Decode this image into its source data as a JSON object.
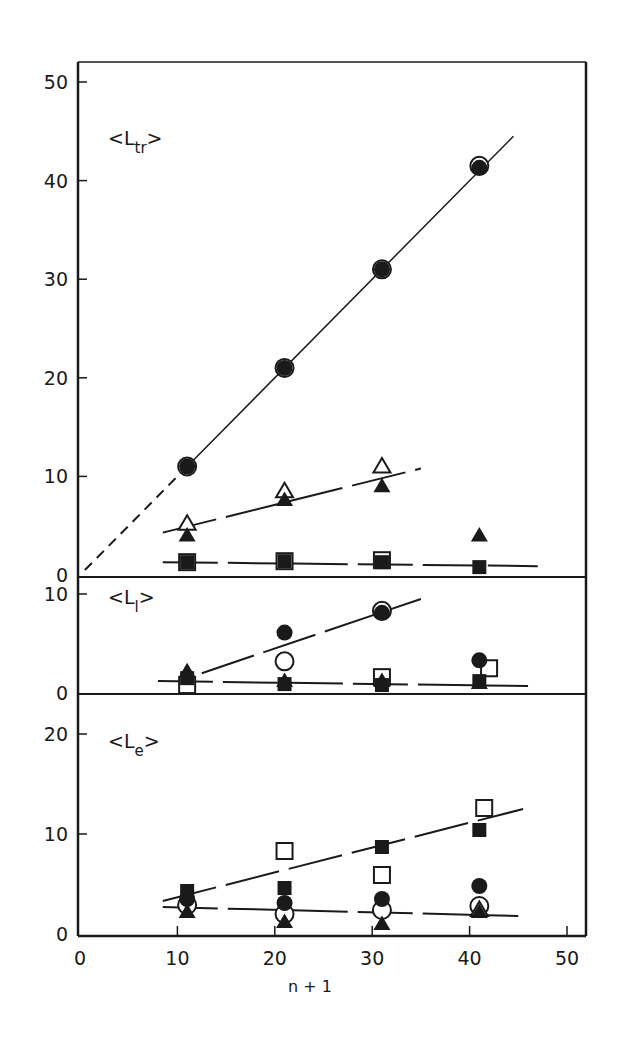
{
  "chart_data": {
    "type": "scatter",
    "xlabel": "n + 1",
    "xlim": [
      0,
      50
    ],
    "xticks": [
      0,
      10,
      20,
      30,
      40,
      50
    ],
    "colors": {
      "ink": "#1a1a1a",
      "background": "#ffffff"
    },
    "panels": [
      {
        "id": "Ltr",
        "label_main": "<L",
        "label_sub": "tr",
        "label_close": ">",
        "ylim": [
          0,
          50
        ],
        "yticks": [
          0,
          10,
          20,
          30,
          40,
          50
        ],
        "series": [
          {
            "name": "open circle",
            "marker": "circle-open",
            "x": [
              11,
              21,
              31,
              41
            ],
            "y": [
              11,
              21,
              31,
              41.5
            ]
          },
          {
            "name": "filled circle",
            "marker": "circle-filled",
            "x": [
              11,
              21,
              31,
              41
            ],
            "y": [
              11,
              21,
              31,
              41.3
            ]
          },
          {
            "name": "open triangle",
            "marker": "triangle-open",
            "x": [
              11,
              21,
              31
            ],
            "y": [
              5.2,
              8.5,
              11
            ]
          },
          {
            "name": "filled triangle",
            "marker": "triangle-filled",
            "x": [
              11,
              21,
              31,
              41
            ],
            "y": [
              4,
              7.6,
              9,
              4
            ]
          },
          {
            "name": "open square",
            "marker": "square-open",
            "x": [
              11,
              21,
              31
            ],
            "y": [
              1.3,
              1.4,
              1.5
            ]
          },
          {
            "name": "filled square",
            "marker": "square-filled",
            "x": [
              11,
              21,
              31,
              41
            ],
            "y": [
              1.3,
              1.4,
              1.3,
              0.8
            ]
          }
        ],
        "fit_lines": [
          {
            "name": "Ltr circle fit",
            "style": "solid",
            "x": [
              11,
              44.5
            ],
            "y": [
              11,
              44.5
            ]
          },
          {
            "name": "Ltr circle extrapolation",
            "style": "dashed",
            "x": [
              0.5,
              11
            ],
            "y": [
              0.5,
              11
            ]
          },
          {
            "name": "Ltr triangle fit",
            "style": "long-dash",
            "x": [
              8.5,
              35
            ],
            "y": [
              4.3,
              10.8
            ]
          },
          {
            "name": "Ltr square fit",
            "style": "long-dash",
            "x": [
              8.5,
              47
            ],
            "y": [
              1.3,
              0.9
            ]
          }
        ]
      },
      {
        "id": "Ll",
        "label_main": "<L",
        "label_sub": "l",
        "label_close": ">",
        "ylim": [
          0,
          11.5
        ],
        "yticks": [
          0,
          10
        ],
        "series": [
          {
            "name": "filled circle",
            "marker": "circle-filled",
            "x": [
              21,
              31,
              41
            ],
            "y": [
              6.1,
              8.1,
              3.3
            ]
          },
          {
            "name": "open circle",
            "marker": "circle-open",
            "x": [
              21,
              31
            ],
            "y": [
              3.2,
              8.3
            ]
          },
          {
            "name": "filled triangle",
            "marker": "triangle-filled",
            "x": [
              11,
              21,
              31,
              41
            ],
            "y": [
              2.2,
              1.2,
              1.2,
              1.0
            ]
          },
          {
            "name": "open square",
            "marker": "square-open",
            "x": [
              11,
              31,
              42
            ],
            "y": [
              0.8,
              1.6,
              2.5
            ]
          },
          {
            "name": "filled square",
            "marker": "square-filled",
            "x": [
              11,
              21,
              31,
              41
            ],
            "y": [
              1.5,
              0.9,
              0.8,
              1.2
            ]
          }
        ],
        "fit_lines": [
          {
            "name": "Ll circle fit",
            "style": "long-dash",
            "x": [
              12.5,
              35
            ],
            "y": [
              2.0,
              9.5
            ]
          },
          {
            "name": "Ll baseline fit",
            "style": "long-dash",
            "x": [
              8,
              46
            ],
            "y": [
              1.2,
              0.7
            ]
          }
        ]
      },
      {
        "id": "Le",
        "label_main": "<L",
        "label_sub": "e",
        "label_close": ">",
        "ylim": [
          0,
          24
        ],
        "yticks": [
          0,
          10,
          20
        ],
        "series": [
          {
            "name": "open square",
            "marker": "square-open",
            "x": [
              21,
              31,
              41.5
            ],
            "y": [
              8.3,
              5.9,
              12.6
            ]
          },
          {
            "name": "filled square",
            "marker": "square-filled",
            "x": [
              11,
              21,
              31,
              41
            ],
            "y": [
              4.3,
              4.6,
              8.7,
              10.4
            ]
          },
          {
            "name": "filled circle",
            "marker": "circle-filled",
            "x": [
              11,
              21,
              31,
              41
            ],
            "y": [
              3.5,
              3.1,
              3.5,
              4.8
            ]
          },
          {
            "name": "open circle",
            "marker": "circle-open",
            "x": [
              11,
              21,
              31,
              41
            ],
            "y": [
              2.9,
              2.0,
              2.4,
              2.8
            ]
          },
          {
            "name": "filled triangle",
            "marker": "triangle-filled",
            "x": [
              11,
              21,
              31,
              41
            ],
            "y": [
              2.2,
              1.2,
              1.0,
              2.2
            ]
          },
          {
            "name": "open triangle",
            "marker": "triangle-open",
            "x": [
              41
            ],
            "y": [
              2.4
            ]
          }
        ],
        "fit_lines": [
          {
            "name": "Le square fit",
            "style": "long-dash",
            "x": [
              8.5,
              45.5
            ],
            "y": [
              3.3,
              12.5
            ]
          },
          {
            "name": "Le baseline fit",
            "style": "long-dash",
            "x": [
              8.5,
              45
            ],
            "y": [
              2.7,
              1.8
            ]
          }
        ]
      }
    ]
  }
}
